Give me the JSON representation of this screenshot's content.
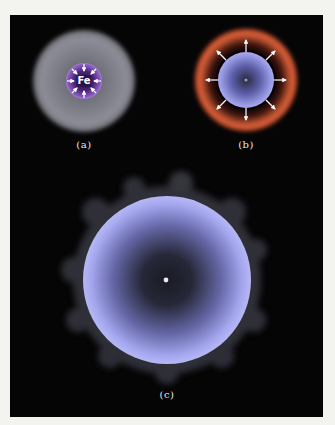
{
  "figure": {
    "panels": [
      {
        "id": "a",
        "label": "(a)",
        "core_text": "Fe",
        "description": "Iron core collapsing inward within gray star envelope"
      },
      {
        "id": "b",
        "label": "(b)",
        "description": "Core rebound with outward shock wave and orange ejecta shell"
      },
      {
        "id": "c",
        "label": "(c)",
        "description": "Expanded blue sphere with faint lumpy halo and central remnant"
      }
    ],
    "colors": {
      "background": "#050506",
      "page": "#f3f3ef",
      "gray_envelope": "#8a8a94",
      "purple_core": "#6a3d9a",
      "orange_shell": "#d8603a",
      "blue_sphere": "#a8aaf0",
      "arrow": "#ffffff"
    }
  }
}
